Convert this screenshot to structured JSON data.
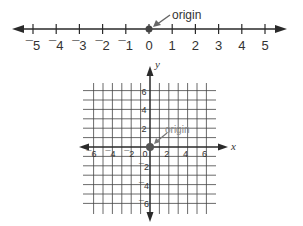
{
  "number_line": {
    "ticks": [
      "-5",
      "-4",
      "-3",
      "-2",
      "-1",
      "0",
      "1",
      "2",
      "3",
      "4",
      "5"
    ],
    "origin_label": "origin"
  },
  "coordinate_plane": {
    "x_axis_label": "x",
    "y_axis_label": "y",
    "x_ticks": [
      "-6",
      "-4",
      "-2",
      "0",
      "2",
      "4",
      "6"
    ],
    "y_ticks": [
      "6",
      "4",
      "2",
      "-2",
      "-4",
      "-6"
    ],
    "origin_label": "origin"
  },
  "colors": {
    "line": "#2a2a2a",
    "point": "#555555",
    "arrow": "#666666",
    "grid": "#444444"
  }
}
